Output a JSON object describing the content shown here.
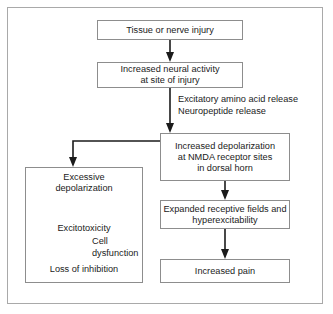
{
  "figure": {
    "frame_color": "#a9a9a9",
    "box_border_color": "#8d8d8d",
    "text_color": "#1b1b1b",
    "background": "#ffffff"
  },
  "nodes": {
    "tissue_injury": {
      "line1": "Tissue or nerve injury"
    },
    "increased_neural_activity": {
      "line1": "Increased neural activity",
      "line2": "at site of injury"
    },
    "increased_depolarization": {
      "line1": "Increased depolarization",
      "line2": "at NMDA receptor sites",
      "line3": "in dorsal horn"
    },
    "expanded_receptive_fields": {
      "line1": "Expanded receptive fields and",
      "line2": "hyperexcitability"
    },
    "increased_pain": {
      "line1": "Increased pain"
    },
    "excessive_depolarization": {
      "line1": "Excessive",
      "line2": "depolarization"
    },
    "excitotoxicity": {
      "line1": "Excitotoxicity"
    },
    "loss_of_inhibition": {
      "line1": "Loss of inhibition"
    }
  },
  "edge_labels": {
    "neurotransmitter_release": {
      "line1": "Excitatory amino acid release",
      "line2": "Neuropeptide release"
    },
    "cell_dysfunction": {
      "line1": "Cell",
      "line2": "dysfunction"
    }
  },
  "connectors": [
    {
      "name": "tissue-injury-to-neural-activity",
      "type": "straight-arrow-down"
    },
    {
      "name": "neural-activity-to-depolarization",
      "type": "straight-arrow-down"
    },
    {
      "name": "depolarization-branch-to-excessive",
      "type": "elbow-arrow-left-down"
    },
    {
      "name": "depolarization-to-expanded-fields",
      "type": "straight-arrow-down"
    },
    {
      "name": "expanded-fields-to-increased-pain",
      "type": "straight-arrow-down"
    },
    {
      "name": "excessive-to-excitotoxicity",
      "type": "straight-arrow-down"
    },
    {
      "name": "excitotoxicity-to-loss-of-inhibition",
      "type": "straight-arrow-down"
    }
  ]
}
